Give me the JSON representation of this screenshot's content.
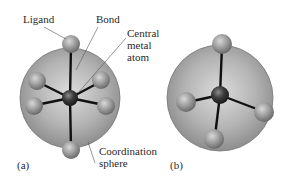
{
  "figure": {
    "panel_a": {
      "label": "(a)",
      "description": "Octahedral complex: central metal atom with six ligands",
      "annotations": {
        "ligand": "Ligand",
        "bond": "Bond",
        "central_metal_atom": [
          "Central",
          "metal",
          "atom"
        ],
        "coordination_sphere": [
          "Coordination",
          "sphere"
        ]
      }
    },
    "panel_b": {
      "label": "(b)",
      "description": "Tetrahedral complex: central metal atom with four ligands"
    },
    "colors": {
      "sphere": "#a8a8a8",
      "ligand": "#9a9a9a",
      "central_atom": "#3a3a3a",
      "bond": "#111111",
      "leader_line": "#555555"
    }
  }
}
